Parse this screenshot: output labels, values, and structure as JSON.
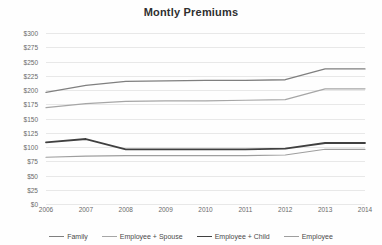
{
  "chart_data": {
    "type": "line",
    "title": "Montly Premiums",
    "xlabel": "",
    "ylabel": "",
    "categories": [
      "2006",
      "2007",
      "2008",
      "2009",
      "2010",
      "2011",
      "2012",
      "2013",
      "2014"
    ],
    "ylim": [
      0,
      300
    ],
    "ytick_step": 25,
    "ytick_labels": [
      "$300",
      "$275",
      "$250",
      "$225",
      "$200",
      "$175",
      "$150",
      "$125",
      "$100",
      "$75",
      "$50",
      "$25",
      "$0"
    ],
    "grid": true,
    "legend_position": "bottom",
    "series": [
      {
        "name": "Family",
        "color": "#7f7f7f",
        "width": 1.3,
        "values": [
          196,
          208,
          215,
          216,
          217,
          217,
          218,
          237,
          237
        ]
      },
      {
        "name": "Employee + Spouse",
        "color": "#a6a6a6",
        "width": 1.2,
        "values": [
          169,
          176,
          180,
          181,
          181,
          182,
          183,
          202,
          202
        ]
      },
      {
        "name": "Employee + Child",
        "color": "#404040",
        "width": 1.8,
        "values": [
          108,
          114,
          96,
          96,
          96,
          96,
          97,
          107,
          107
        ]
      },
      {
        "name": "Employee",
        "color": "#9e9e9e",
        "width": 1.2,
        "values": [
          82,
          84,
          85,
          85,
          85,
          85,
          86,
          96,
          96
        ]
      }
    ]
  }
}
